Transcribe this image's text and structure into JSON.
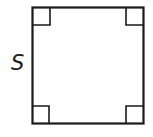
{
  "figure": {
    "shape": "square",
    "side_label": "S",
    "stroke_color": "#1a1a1a",
    "right_angle_markers": 4
  }
}
